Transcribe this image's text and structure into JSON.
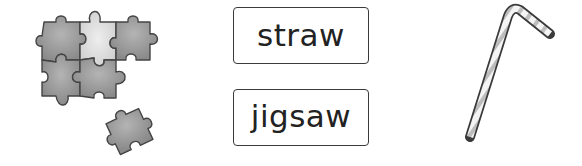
{
  "words": [
    {
      "label": "straw"
    },
    {
      "label": "jigsaw"
    }
  ],
  "images": [
    {
      "name": "jigsaw-puzzle-pieces",
      "description": "grey jigsaw puzzle pieces"
    },
    {
      "name": "bendy-straw",
      "description": "striped bendy drinking straw"
    }
  ],
  "colors": {
    "piece_dark": "#8e8e8e",
    "piece_light": "#d6d6d6",
    "outline": "#444444",
    "box_border": "#3a3a3a"
  }
}
